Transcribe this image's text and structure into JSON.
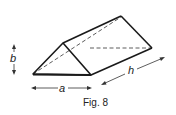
{
  "figure": {
    "caption": "Fig. 8",
    "labels": {
      "base": "a",
      "height": "b",
      "length": "h"
    },
    "colors": {
      "stroke": "#1a1a1a",
      "background": "#ffffff"
    }
  }
}
